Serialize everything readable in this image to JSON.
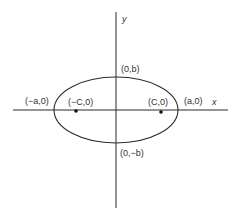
{
  "diagram": {
    "axes": {
      "x_label": "x",
      "y_label": "y"
    },
    "points": {
      "vertex_left": "(−a,0)",
      "vertex_right": "(a,0)",
      "covertex_top": "(0,b)",
      "covertex_bottom": "(0,−b)",
      "focus_left": "(−C,0)",
      "focus_right": "(C,0)"
    },
    "colors": {
      "stroke": "#2b2b2b",
      "text": "#333333",
      "background": "#ffffff"
    }
  }
}
